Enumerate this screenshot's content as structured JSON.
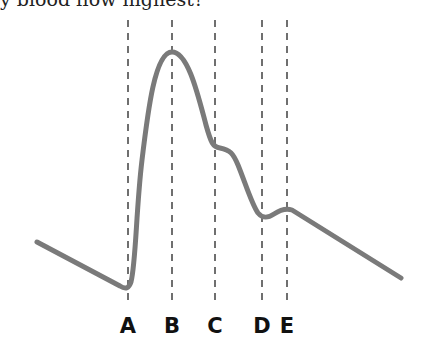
{
  "question": {
    "text": "y blood flow highest?"
  },
  "diagram": {
    "curve_color": "#7a7a7a",
    "guide_color": "#333333",
    "markers": [
      {
        "label": "A",
        "x": 128
      },
      {
        "label": "B",
        "x": 172
      },
      {
        "label": "C",
        "x": 215
      },
      {
        "label": "D",
        "x": 262
      },
      {
        "label": "E",
        "x": 287
      }
    ]
  }
}
